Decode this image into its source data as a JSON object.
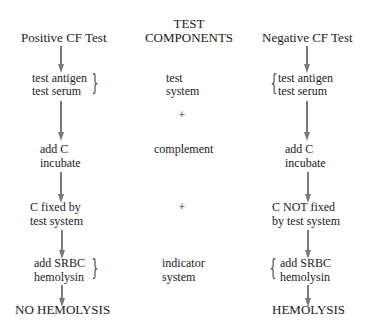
{
  "headers": {
    "positive": "Positive CF Test",
    "components_line1": "TEST",
    "components_line2": "COMPONENTS",
    "negative": "Negative CF Test"
  },
  "positive_column": {
    "step1_line1": "test antigen",
    "step1_line2": "test serum",
    "step2_line1": "add C",
    "step2_line2": "incubate",
    "step3_line1": "C  fixed by",
    "step3_line2": "test system",
    "step4_line1": "add SRBC",
    "step4_line2": "hemolysin",
    "result": "NO HEMOLYSIS"
  },
  "components_column": {
    "item1_line1": "test",
    "item1_line2": "system",
    "plus1": "+",
    "item2": "complement",
    "plus2": "+",
    "item3_line1": "indicator",
    "item3_line2": "system"
  },
  "negative_column": {
    "step1_line1": "test antigen",
    "step1_line2": "test serum",
    "step2_line1": "add C",
    "step2_line2": "incubate",
    "step3_line1": "C  NOT fixed",
    "step3_line2": "by test system",
    "step4_line1": "add SRBC",
    "step4_line2": "hemolysin",
    "result": "HEMOLYSIS"
  },
  "colors": {
    "arrow": "#7a7a7a",
    "text": "#1a1a1a"
  }
}
